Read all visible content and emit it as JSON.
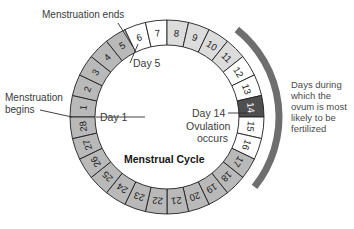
{
  "figure": {
    "title": "Menstrual Cycle",
    "center_labels": {
      "day1": "Day 1",
      "day5": "Day 5",
      "day14": "Day 14",
      "ovulation_line1": "Ovulation",
      "ovulation_line2": "occurs",
      "cycle_title": "Menstrual Cycle"
    },
    "callouts": [
      {
        "id": "menstruation-ends",
        "line1": "Menstruation ends",
        "line2": ""
      },
      {
        "id": "menstruation-begins",
        "line1": "Menstruation",
        "line2": "begins"
      }
    ],
    "side_note": {
      "id": "fertile-window-note",
      "lines": [
        "Days during",
        "which the",
        "ovum is most",
        "likely to be",
        "fertilized"
      ]
    },
    "colors": {
      "menstrual_gray": "#b9b9b9",
      "follicular_light": "#d8d8d8",
      "white_phase": "#fefefe",
      "ovulation_dark": "#4f4f4f",
      "luteal_gray": "#b9b9b9",
      "arc_band": "#6e6e6e",
      "outline": "#1f1f1f",
      "text": "#3a3a3a",
      "background": "#ffffff"
    },
    "ring": {
      "center_x": 167,
      "center_y": 117,
      "outer_radius": 97,
      "inner_radius": 72,
      "segment_count": 28,
      "start_angle_deg": 180,
      "direction": "clockwise"
    },
    "fertile_arc": {
      "start_day": 11,
      "end_day": 17,
      "radius": 112,
      "thickness": 7
    },
    "days": [
      {
        "day": 1,
        "label": "1",
        "phase": "menstruation",
        "fill": "#b9b9b9"
      },
      {
        "day": 2,
        "label": "2",
        "phase": "menstruation",
        "fill": "#b9b9b9"
      },
      {
        "day": 3,
        "label": "3",
        "phase": "menstruation",
        "fill": "#b9b9b9"
      },
      {
        "day": 4,
        "label": "4",
        "phase": "menstruation",
        "fill": "#b9b9b9"
      },
      {
        "day": 5,
        "label": "5",
        "phase": "menstruation",
        "fill": "#b9b9b9"
      },
      {
        "day": 6,
        "label": "6",
        "phase": "follicular",
        "fill": "#fefefe"
      },
      {
        "day": 7,
        "label": "7",
        "phase": "follicular",
        "fill": "#fefefe"
      },
      {
        "day": 8,
        "label": "8",
        "phase": "follicular",
        "fill": "#dcdcdc"
      },
      {
        "day": 9,
        "label": "9",
        "phase": "follicular",
        "fill": "#dcdcdc"
      },
      {
        "day": 10,
        "label": "10",
        "phase": "follicular",
        "fill": "#dcdcdc"
      },
      {
        "day": 11,
        "label": "11",
        "phase": "follicular",
        "fill": "#dcdcdc"
      },
      {
        "day": 12,
        "label": "12",
        "phase": "fertile",
        "fill": "#fefefe"
      },
      {
        "day": 13,
        "label": "13",
        "phase": "fertile",
        "fill": "#fefefe"
      },
      {
        "day": 14,
        "label": "14",
        "phase": "ovulation",
        "fill": "#4f4f4f"
      },
      {
        "day": 15,
        "label": "15",
        "phase": "fertile",
        "fill": "#fefefe"
      },
      {
        "day": 16,
        "label": "16",
        "phase": "fertile",
        "fill": "#fefefe"
      },
      {
        "day": 17,
        "label": "17",
        "phase": "luteal",
        "fill": "#b9b9b9"
      },
      {
        "day": 18,
        "label": "18",
        "phase": "luteal",
        "fill": "#b9b9b9"
      },
      {
        "day": 19,
        "label": "19",
        "phase": "luteal",
        "fill": "#b9b9b9"
      },
      {
        "day": 20,
        "label": "20",
        "phase": "luteal",
        "fill": "#b9b9b9"
      },
      {
        "day": 21,
        "label": "21",
        "phase": "luteal",
        "fill": "#b9b9b9"
      },
      {
        "day": 22,
        "label": "22",
        "phase": "luteal",
        "fill": "#b9b9b9"
      },
      {
        "day": 23,
        "label": "23",
        "phase": "luteal",
        "fill": "#b9b9b9"
      },
      {
        "day": 24,
        "label": "24",
        "phase": "luteal",
        "fill": "#b9b9b9"
      },
      {
        "day": 25,
        "label": "25",
        "phase": "luteal",
        "fill": "#b9b9b9"
      },
      {
        "day": 26,
        "label": "26",
        "phase": "luteal",
        "fill": "#b9b9b9"
      },
      {
        "day": 27,
        "label": "27",
        "phase": "luteal",
        "fill": "#b9b9b9"
      },
      {
        "day": 28,
        "label": "28",
        "phase": "luteal",
        "fill": "#b9b9b9"
      }
    ]
  }
}
